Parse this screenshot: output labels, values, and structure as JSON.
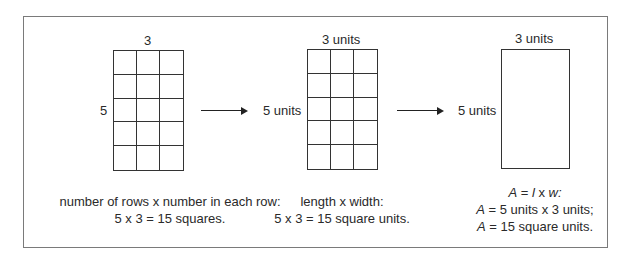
{
  "panels": [
    {
      "top_label": "3",
      "side_label": "5",
      "rows": 5,
      "cols": 3,
      "caption_line1": "number of rows x number in each row:",
      "caption_line2": "5 x 3 = 15 squares."
    },
    {
      "top_label": "3 units",
      "side_label": "5 units",
      "rows": 5,
      "cols": 3,
      "caption_line1": "length x width:",
      "caption_line2": "5 x 3 = 15 square units."
    },
    {
      "top_label": "3 units",
      "side_label": "5 units",
      "caption_line1": {
        "a": "A",
        "eq": " = ",
        "l": "l",
        "x": " x ",
        "w": "w",
        "end": ":"
      },
      "caption_line2": {
        "a": "A",
        "rest": " = 5 units x 3 units;"
      },
      "caption_line3": {
        "a": "A",
        "rest": " = 15 square units."
      }
    }
  ],
  "arrows": [
    "arrow-1",
    "arrow-2"
  ]
}
